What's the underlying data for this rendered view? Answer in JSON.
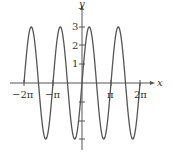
{
  "chart_data": {
    "type": "line",
    "title": "",
    "function": "y = 3 sin(2x)",
    "xlabel": "x",
    "ylabel": "y",
    "xlim": [
      -6.2832,
      6.2832
    ],
    "ylim": [
      -3,
      3
    ],
    "x_ticks": [
      {
        "value": -6.2832,
        "label": "−2π"
      },
      {
        "value": -3.1416,
        "label": "−π"
      },
      {
        "value": 3.1416,
        "label": "π"
      },
      {
        "value": 6.2832,
        "label": "2π"
      }
    ],
    "y_ticks": [
      {
        "value": 1,
        "label": "1"
      },
      {
        "value": 2,
        "label": "2"
      },
      {
        "value": 3,
        "label": "3"
      },
      {
        "value": -1,
        "label": ""
      },
      {
        "value": -2,
        "label": ""
      },
      {
        "value": -3,
        "label": ""
      }
    ],
    "amplitude": 3,
    "period": 3.1416,
    "grid": false,
    "legend": null,
    "line_color": "#555555"
  },
  "labels": {
    "x_axis": "x",
    "y_axis": "y",
    "xt0": "−2π",
    "xt1": "−π",
    "xt2": "π",
    "xt3": "2π",
    "yt1": "1",
    "yt2": "2",
    "yt3": "3"
  }
}
